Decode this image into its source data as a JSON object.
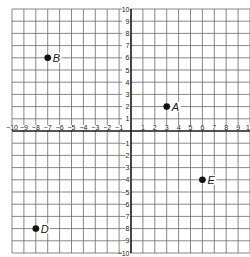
{
  "chart_data": {
    "type": "scatter",
    "title": "",
    "xlabel": "",
    "ylabel": "",
    "xlim": [
      -10,
      10
    ],
    "ylim": [
      -10,
      10
    ],
    "grid": true,
    "x_ticks": [
      -10,
      -9,
      -8,
      -7,
      -6,
      -5,
      -4,
      -3,
      -2,
      -1,
      1,
      2,
      3,
      4,
      5,
      6,
      7,
      8,
      9,
      10
    ],
    "y_ticks": [
      10,
      9,
      8,
      7,
      6,
      5,
      4,
      3,
      2,
      1,
      -1,
      -2,
      -3,
      -4,
      -5,
      -6,
      -7,
      -8,
      -9,
      -10
    ],
    "points": [
      {
        "label": "A",
        "x": 3,
        "y": 2
      },
      {
        "label": "B",
        "x": -7,
        "y": 6
      },
      {
        "label": "D",
        "x": -8,
        "y": -8
      },
      {
        "label": "E",
        "x": 6,
        "y": -4
      }
    ]
  },
  "colors": {
    "grid": "#6b6b6b",
    "axis": "#1a1a1a",
    "point": "#111111",
    "text": "#222222"
  }
}
